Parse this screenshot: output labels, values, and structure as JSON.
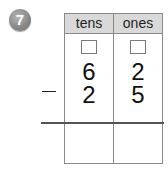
{
  "problem": {
    "number": "7",
    "badge_color": "#8a8a8a",
    "columns": [
      {
        "label": "tens"
      },
      {
        "label": "ones"
      }
    ],
    "minuend": {
      "tens": "6",
      "ones": "2"
    },
    "operator": "−",
    "subtrahend": {
      "tens": "2",
      "ones": "5"
    },
    "answer": {
      "tens": "",
      "ones": ""
    },
    "regroup": {
      "tens": "",
      "ones": ""
    },
    "header_color": "#d9d9d9"
  }
}
